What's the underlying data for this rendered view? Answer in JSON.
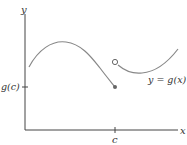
{
  "diagram": {
    "type": "function-graph-jump-discontinuity",
    "axes": {
      "x_label": "x",
      "y_label": "y"
    },
    "ticks": {
      "x_tick_label": "c",
      "y_tick_label": "g(c)"
    },
    "curve_label": "y = g(x)",
    "points": {
      "closed_point": "(c, g(c))",
      "open_point": "right-hand limit at c"
    },
    "colors": {
      "axis": "#444444",
      "curve": "#888888",
      "text": "#333333"
    }
  }
}
